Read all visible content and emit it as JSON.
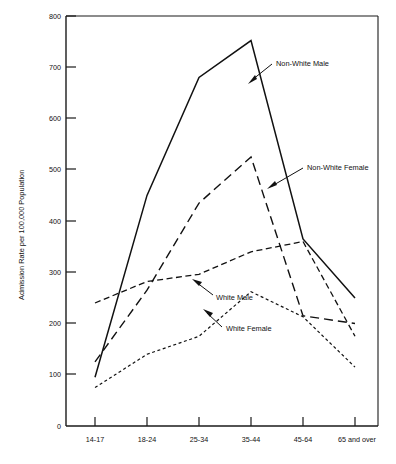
{
  "chart_data": {
    "type": "line",
    "title": "",
    "xlabel": "",
    "ylabel": "Admission Rate per 100,000 Population",
    "categories": [
      "14-17",
      "18-24",
      "25-34",
      "35-44",
      "45-64",
      "65 and over"
    ],
    "ylim": [
      0,
      800
    ],
    "yticks": [
      0,
      100,
      200,
      300,
      400,
      500,
      600,
      700,
      800
    ],
    "ytick_labels": [
      "0",
      "100",
      "200",
      "300",
      "400",
      "500",
      "600",
      "700",
      "800"
    ],
    "grid": false,
    "legend": "inline-annotations",
    "series": [
      {
        "name": "Non-White Male",
        "style": "solid",
        "values": [
          95,
          450,
          680,
          752,
          365,
          250
        ]
      },
      {
        "name": "Non-White Female",
        "style": "long-dash",
        "values": [
          125,
          265,
          435,
          525,
          215,
          200
        ]
      },
      {
        "name": "White Male",
        "style": "medium-dash",
        "values": [
          240,
          282,
          296,
          340,
          360,
          175
        ]
      },
      {
        "name": "White Female",
        "style": "dotted",
        "values": [
          75,
          140,
          175,
          262,
          213,
          115
        ]
      }
    ],
    "annotations": [
      {
        "label": "Non-White Male",
        "series": "Non-White Male"
      },
      {
        "label": "Non-White Female",
        "series": "Non-White Female"
      },
      {
        "label": "White Male",
        "series": "White Male"
      },
      {
        "label": "White Female",
        "series": "White Female"
      }
    ]
  }
}
